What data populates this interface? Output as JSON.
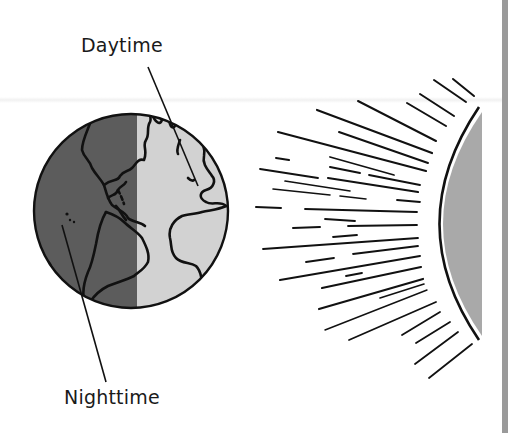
{
  "diagram": {
    "labels": {
      "daytime": "Daytime",
      "nighttime": "Nighttime"
    },
    "objects": {
      "earth": {
        "name": "Earth",
        "night_side": "left",
        "day_side": "right"
      },
      "sun": {
        "name": "Sun",
        "position": "right",
        "rays_direction": "left"
      }
    },
    "colors": {
      "night_fill": "#5c5c5c",
      "day_fill": "#d2d2d2",
      "sun_fill": "#a9a9a9",
      "outline": "#111111",
      "edge_bar": "#9a9a9a",
      "background": "#ffffff"
    }
  }
}
